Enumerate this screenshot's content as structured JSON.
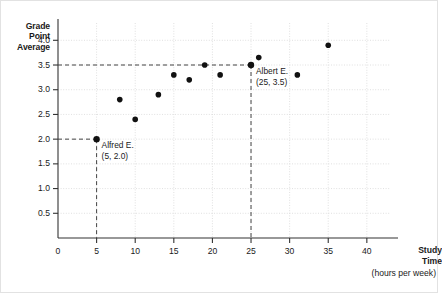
{
  "chart_data": {
    "type": "scatter",
    "title": "",
    "ylabel": "Grade Point Average",
    "xlabel": "Study Time",
    "xlabel_sub": "(hours per week)",
    "xlim": [
      0,
      43
    ],
    "ylim": [
      0,
      4.35
    ],
    "grid": true,
    "legend": "none",
    "xticks": [
      {
        "value": 0,
        "label": "0"
      },
      {
        "value": 5,
        "label": "5"
      },
      {
        "value": 10,
        "label": "10"
      },
      {
        "value": 15,
        "label": "15"
      },
      {
        "value": 20,
        "label": "20"
      },
      {
        "value": 25,
        "label": "25"
      },
      {
        "value": 30,
        "label": "30"
      },
      {
        "value": 35,
        "label": "35"
      },
      {
        "value": 40,
        "label": "40"
      }
    ],
    "yticks": [
      {
        "value": 0.5,
        "label": "0.5"
      },
      {
        "value": 1.0,
        "label": "1.0"
      },
      {
        "value": 1.5,
        "label": "1.5"
      },
      {
        "value": 2.0,
        "label": "2.0"
      },
      {
        "value": 2.5,
        "label": "2.5"
      },
      {
        "value": 3.0,
        "label": "3.0"
      },
      {
        "value": 3.5,
        "label": "3.5"
      },
      {
        "value": 4.0,
        "label": "4.0"
      }
    ],
    "ylabel_lines": [
      "Grade",
      "Point",
      "Average"
    ],
    "points": [
      {
        "x": 5,
        "y": 2.0,
        "name": "Alfred E."
      },
      {
        "x": 8,
        "y": 2.8,
        "name": ""
      },
      {
        "x": 10,
        "y": 2.4,
        "name": ""
      },
      {
        "x": 13,
        "y": 2.9,
        "name": ""
      },
      {
        "x": 15,
        "y": 3.3,
        "name": ""
      },
      {
        "x": 17,
        "y": 3.2,
        "name": ""
      },
      {
        "x": 19,
        "y": 3.5,
        "name": ""
      },
      {
        "x": 21,
        "y": 3.3,
        "name": ""
      },
      {
        "x": 25,
        "y": 3.5,
        "name": "Albert E."
      },
      {
        "x": 26,
        "y": 3.65,
        "name": ""
      },
      {
        "x": 31,
        "y": 3.3,
        "name": ""
      },
      {
        "x": 35,
        "y": 3.9,
        "name": ""
      }
    ],
    "annotations": [
      {
        "id": "alfred",
        "name_line": "Alfred E.",
        "coord_line": "(5, 2.0)",
        "point_x": 5,
        "point_y": 2.0
      },
      {
        "id": "albert",
        "name_line": "Albert E.",
        "coord_line": "(25, 3.5)",
        "point_x": 25,
        "point_y": 3.5
      }
    ],
    "guidelines": [
      {
        "type": "horizontal",
        "value": 2.0,
        "from_x": 0,
        "to_x": 5
      },
      {
        "type": "vertical",
        "value": 5,
        "from_y": 0,
        "to_y": 2.0
      },
      {
        "type": "horizontal",
        "value": 3.5,
        "from_x": 0,
        "to_x": 25
      },
      {
        "type": "vertical",
        "value": 25,
        "from_y": 0,
        "to_y": 3.5
      }
    ],
    "colors": {
      "point": "#111111",
      "axis": "#333333",
      "grid": "#d8d8d8",
      "guideline": "#444444",
      "text": "#1a1a1a",
      "background": "#ffffff",
      "border": "#e2e2e2"
    }
  }
}
